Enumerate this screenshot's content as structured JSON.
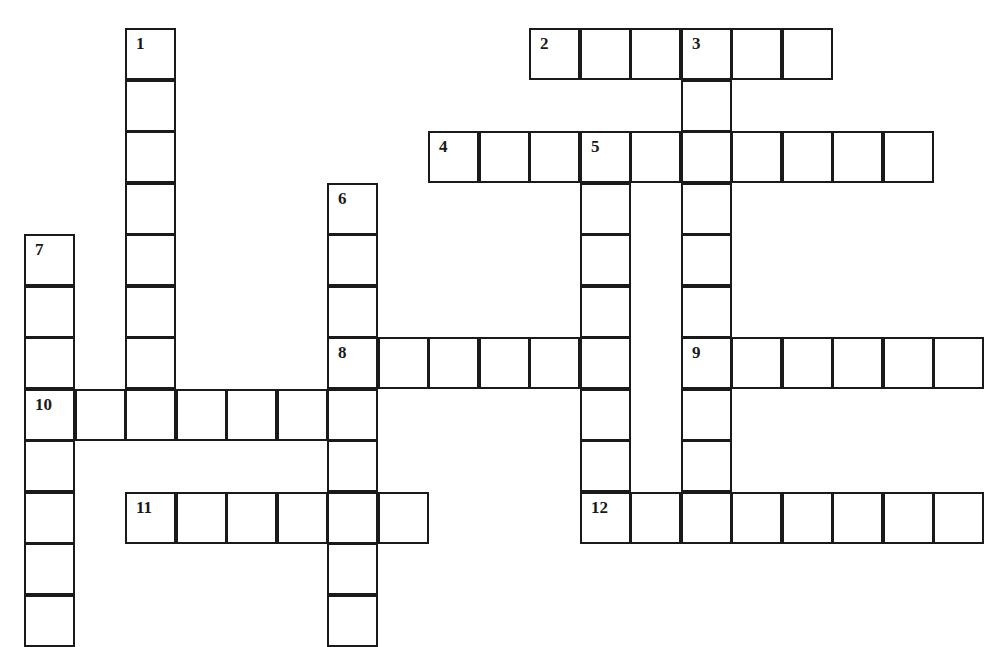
{
  "puzzle": {
    "type": "crossword",
    "cell_size_px": 50.5,
    "origin": {
      "x": 24,
      "y": 28
    },
    "row_height_px": 51.5,
    "colors": {
      "border": "#1a1a1a",
      "cell_fill": "#ffffff",
      "background": "#ffffff"
    },
    "clues": [
      {
        "number": "1",
        "direction": "down",
        "row": 0,
        "col": 2,
        "length": 8
      },
      {
        "number": "2",
        "direction": "across",
        "row": 0,
        "col": 10,
        "length": 6
      },
      {
        "number": "3",
        "direction": "down",
        "row": 0,
        "col": 13,
        "length": 10
      },
      {
        "number": "4",
        "direction": "across",
        "row": 2,
        "col": 8,
        "length": 10
      },
      {
        "number": "5",
        "direction": "down",
        "row": 2,
        "col": 11,
        "length": 7
      },
      {
        "number": "6",
        "direction": "down",
        "row": 3,
        "col": 6,
        "length": 9
      },
      {
        "number": "7",
        "direction": "down",
        "row": 4,
        "col": 0,
        "length": 8
      },
      {
        "number": "8",
        "direction": "across",
        "row": 6,
        "col": 6,
        "length": 6
      },
      {
        "number": "9",
        "direction": "across",
        "row": 6,
        "col": 13,
        "length": 6
      },
      {
        "number": "10",
        "direction": "across",
        "row": 7,
        "col": 0,
        "length": 7
      },
      {
        "number": "11",
        "direction": "across",
        "row": 9,
        "col": 2,
        "length": 6
      },
      {
        "number": "12",
        "direction": "across",
        "row": 9,
        "col": 11,
        "length": 8
      }
    ]
  }
}
